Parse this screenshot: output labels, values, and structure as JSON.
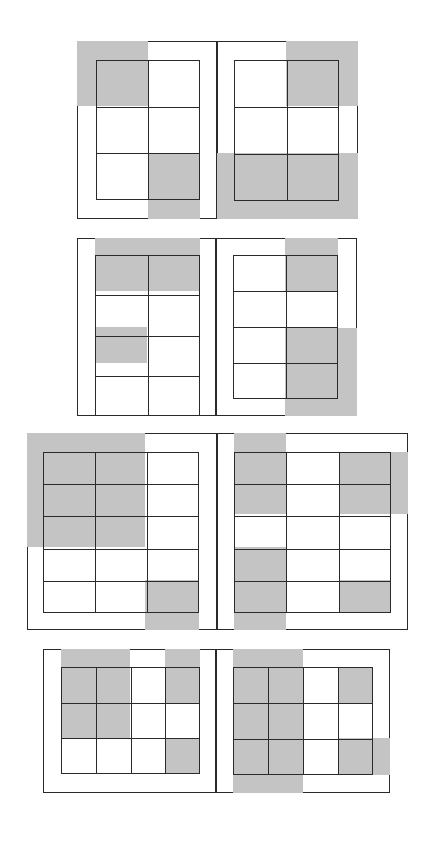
{
  "colors": {
    "shade": "#c4c4c4",
    "line": "#2a2a2a",
    "background": "#ffffff"
  },
  "panels": [
    {
      "id": "panel-1",
      "x": 77,
      "y": 41,
      "w": 281,
      "h": 178,
      "divider_x": 140,
      "pages": [
        {
          "x": 0,
          "y": 0,
          "w": 140,
          "h": 178,
          "inner": {
            "x": 19,
            "y": 19,
            "w": 104,
            "h": 140,
            "cols": 2,
            "rows": 3
          },
          "shades": [
            {
              "x": 0,
              "y": 0,
              "w": 71,
              "h": 65
            },
            {
              "x": 71,
              "y": 112,
              "w": 52,
              "h": 66
            }
          ]
        },
        {
          "x": 140,
          "y": 0,
          "w": 141,
          "h": 178,
          "inner": {
            "x": 17,
            "y": 19,
            "w": 105,
            "h": 141,
            "cols": 2,
            "rows": 3
          },
          "shades": [
            {
              "x": 69,
              "y": 0,
              "w": 72,
              "h": 65
            },
            {
              "x": 0,
              "y": 112,
              "w": 141,
              "h": 66
            }
          ]
        }
      ]
    },
    {
      "id": "panel-2",
      "x": 77,
      "y": 238,
      "w": 280,
      "h": 178,
      "divider_x": 139,
      "pages": [
        {
          "x": 0,
          "y": 0,
          "w": 139,
          "h": 178,
          "inner": {
            "x": 18,
            "y": 17,
            "w": 105,
            "h": 161,
            "cols": 2,
            "rows": 4,
            "top_extra": true
          },
          "shades": [
            {
              "x": 18,
              "y": 0,
              "w": 105,
              "h": 53
            },
            {
              "x": 18,
              "y": 89,
              "w": 52,
              "h": 36
            }
          ]
        },
        {
          "x": 139,
          "y": 0,
          "w": 141,
          "h": 178,
          "inner": {
            "x": 17,
            "y": 17,
            "w": 105,
            "h": 144,
            "cols": 2,
            "rows": 4
          },
          "shades": [
            {
              "x": 69,
              "y": 0,
              "w": 53,
              "h": 53
            },
            {
              "x": 69,
              "y": 90,
              "w": 72,
              "h": 88
            }
          ]
        }
      ]
    },
    {
      "id": "panel-3",
      "x": 27,
      "y": 433,
      "w": 381,
      "h": 197,
      "divider_x": 190,
      "pages": [
        {
          "x": 0,
          "y": 0,
          "w": 190,
          "h": 197,
          "inner": {
            "x": 16,
            "y": 19,
            "w": 156,
            "h": 161,
            "cols": 3,
            "rows": 5
          },
          "shades": [
            {
              "x": 0,
              "y": 0,
              "w": 118,
              "h": 114
            },
            {
              "x": 118,
              "y": 147,
              "w": 54,
              "h": 50
            }
          ]
        },
        {
          "x": 190,
          "y": 0,
          "w": 191,
          "h": 197,
          "inner": {
            "x": 17,
            "y": 19,
            "w": 157,
            "h": 161,
            "cols": 3,
            "rows": 5
          },
          "shades": [
            {
              "x": 17,
              "y": 0,
              "w": 52,
              "h": 81
            },
            {
              "x": 122,
              "y": 19,
              "w": 69,
              "h": 62
            },
            {
              "x": 17,
              "y": 114,
              "w": 52,
              "h": 83
            },
            {
              "x": 122,
              "y": 147,
              "w": 52,
              "h": 33
            }
          ]
        }
      ]
    },
    {
      "id": "panel-4",
      "x": 43,
      "y": 649,
      "w": 347,
      "h": 144,
      "divider_x": 173,
      "pages": [
        {
          "x": 0,
          "y": 0,
          "w": 173,
          "h": 144,
          "inner": {
            "x": 18,
            "y": 18,
            "w": 139,
            "h": 107,
            "cols": 4,
            "rows": 3,
            "top_extra": true
          },
          "shades": [
            {
              "x": 18,
              "y": 0,
              "w": 69,
              "h": 89
            },
            {
              "x": 122,
              "y": 0,
              "w": 35,
              "h": 54
            },
            {
              "x": 122,
              "y": 90,
              "w": 35,
              "h": 35
            }
          ]
        },
        {
          "x": 173,
          "y": 0,
          "w": 174,
          "h": 144,
          "inner": {
            "x": 17,
            "y": 18,
            "w": 140,
            "h": 108,
            "cols": 4,
            "rows": 3
          },
          "shades": [
            {
              "x": 17,
              "y": 0,
              "w": 70,
              "h": 144
            },
            {
              "x": 122,
              "y": 18,
              "w": 35,
              "h": 36
            },
            {
              "x": 122,
              "y": 89,
              "w": 52,
              "h": 37
            }
          ]
        }
      ]
    }
  ]
}
